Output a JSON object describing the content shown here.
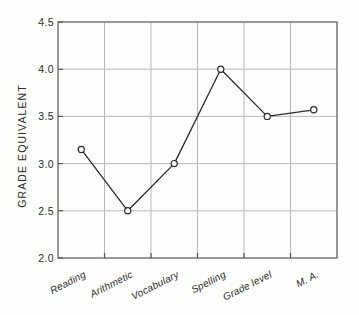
{
  "chart_data": {
    "type": "line",
    "title": "",
    "xlabel": "",
    "ylabel": "GRADE  EQUIVALENT",
    "categories": [
      "Reading",
      "Arithmetic",
      "Vocabulary",
      "Spelling",
      "Grade level",
      "M. A."
    ],
    "values": [
      3.15,
      2.5,
      3.0,
      4.0,
      3.5,
      3.57
    ],
    "ylim": [
      2.0,
      4.5
    ],
    "yticks": [
      "2.0",
      "2.5",
      "3.0",
      "3.5",
      "4.0",
      "4.5"
    ],
    "ytick_values": [
      2.0,
      2.5,
      3.0,
      3.5,
      4.0,
      4.5
    ],
    "grid": true,
    "legend": "none",
    "marker": "open-circle",
    "line_color": "#2b2b2b",
    "grid_color": "#b9b9b9",
    "axis_color": "#555555",
    "background_color": "#fdfdfb",
    "marker_face_color": "#ffffff"
  }
}
